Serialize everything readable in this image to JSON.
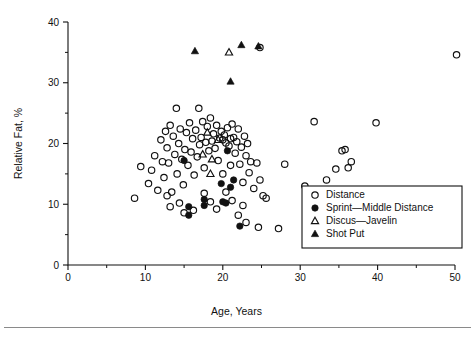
{
  "chart_data": {
    "type": "scatter",
    "title": "",
    "xlabel": "Age, Years",
    "ylabel": "Relative Fat, %",
    "xlim": [
      0,
      50
    ],
    "ylim": [
      0,
      40
    ],
    "xticks": [
      0,
      10,
      20,
      30,
      40,
      50
    ],
    "xtick_labels": [
      "0",
      "10",
      "20",
      "30",
      "40",
      "50"
    ],
    "xminor_ticks": [
      5,
      15,
      25,
      35,
      45
    ],
    "yticks": [
      0,
      10,
      20,
      30,
      40
    ],
    "ytick_labels": [
      "0",
      "10",
      "20",
      "30",
      "40"
    ],
    "yminor_ticks": [
      5,
      15,
      25,
      35
    ],
    "grid": false,
    "legend_position": "lower-right",
    "series": [
      {
        "name": "Distance",
        "marker": "open-circle",
        "color": "#111111",
        "points": [
          [
            8.6,
            11.0
          ],
          [
            9.4,
            16.2
          ],
          [
            10.4,
            13.4
          ],
          [
            10.8,
            15.6
          ],
          [
            11.2,
            18.0
          ],
          [
            11.6,
            12.3
          ],
          [
            12.0,
            20.6
          ],
          [
            12.2,
            17.0
          ],
          [
            12.4,
            14.4
          ],
          [
            12.6,
            22.0
          ],
          [
            12.8,
            19.3
          ],
          [
            13.0,
            16.8
          ],
          [
            13.2,
            23.0
          ],
          [
            13.4,
            12.0
          ],
          [
            13.6,
            21.2
          ],
          [
            13.8,
            18.2
          ],
          [
            14.0,
            25.8
          ],
          [
            14.1,
            15.0
          ],
          [
            14.3,
            20.0
          ],
          [
            14.5,
            22.4
          ],
          [
            14.7,
            17.4
          ],
          [
            14.9,
            13.2
          ],
          [
            15.1,
            19.0
          ],
          [
            15.3,
            21.8
          ],
          [
            15.5,
            16.4
          ],
          [
            15.7,
            23.4
          ],
          [
            15.9,
            18.6
          ],
          [
            16.1,
            20.8
          ],
          [
            16.3,
            14.8
          ],
          [
            16.5,
            22.2
          ],
          [
            16.7,
            17.8
          ],
          [
            16.9,
            25.8
          ],
          [
            17.0,
            19.8
          ],
          [
            17.2,
            21.0
          ],
          [
            17.4,
            23.6
          ],
          [
            17.6,
            16.0
          ],
          [
            17.8,
            20.2
          ],
          [
            18.0,
            22.8
          ],
          [
            18.2,
            18.8
          ],
          [
            18.4,
            24.2
          ],
          [
            18.6,
            20.4
          ],
          [
            18.8,
            21.6
          ],
          [
            19.0,
            19.2
          ],
          [
            19.2,
            23.0
          ],
          [
            19.4,
            17.2
          ],
          [
            19.6,
            20.9
          ],
          [
            19.8,
            22.0
          ],
          [
            20.0,
            20.6
          ],
          [
            20.2,
            21.4
          ],
          [
            20.4,
            20.1
          ],
          [
            20.6,
            22.6
          ],
          [
            20.8,
            19.6
          ],
          [
            21.0,
            20.8
          ],
          [
            21.2,
            23.2
          ],
          [
            21.4,
            21.0
          ],
          [
            21.6,
            18.4
          ],
          [
            21.8,
            20.3
          ],
          [
            22.0,
            22.4
          ],
          [
            22.2,
            16.6
          ],
          [
            22.4,
            19.4
          ],
          [
            22.6,
            13.6
          ],
          [
            22.8,
            21.2
          ],
          [
            23.0,
            18.0
          ],
          [
            23.2,
            20.0
          ],
          [
            23.4,
            15.2
          ],
          [
            23.6,
            17.0
          ],
          [
            24.0,
            12.6
          ],
          [
            24.4,
            16.8
          ],
          [
            24.8,
            14.0
          ],
          [
            25.2,
            11.4
          ],
          [
            13.2,
            9.6
          ],
          [
            14.4,
            10.2
          ],
          [
            15.0,
            8.6
          ],
          [
            16.2,
            9.0
          ],
          [
            17.6,
            11.8
          ],
          [
            18.4,
            10.4
          ],
          [
            19.2,
            9.2
          ],
          [
            20.4,
            12.0
          ],
          [
            21.2,
            10.6
          ],
          [
            22.0,
            8.2
          ],
          [
            22.6,
            9.8
          ],
          [
            23.0,
            7.0
          ],
          [
            24.6,
            6.2
          ],
          [
            27.2,
            6.0
          ],
          [
            28.0,
            16.6
          ],
          [
            30.6,
            13.0
          ],
          [
            31.8,
            23.6
          ],
          [
            33.4,
            14.0
          ],
          [
            34.6,
            15.8
          ],
          [
            35.4,
            18.8
          ],
          [
            35.8,
            19.0
          ],
          [
            36.2,
            16.0
          ],
          [
            36.6,
            17.0
          ],
          [
            39.8,
            23.4
          ],
          [
            50.2,
            34.6
          ],
          [
            24.8,
            35.8
          ],
          [
            25.6,
            11.0
          ],
          [
            12.8,
            11.4
          ],
          [
            20.0,
            15.0
          ],
          [
            21.0,
            16.4
          ]
        ]
      },
      {
        "name": "Sprint—Middle Distance",
        "marker": "filled-circle",
        "color": "#111111",
        "points": [
          [
            15.0,
            17.2
          ],
          [
            20.6,
            18.8
          ],
          [
            21.4,
            14.0
          ],
          [
            21.0,
            12.8
          ],
          [
            15.6,
            9.6
          ],
          [
            15.6,
            8.2
          ],
          [
            17.6,
            10.8
          ],
          [
            17.6,
            9.8
          ],
          [
            20.0,
            10.4
          ],
          [
            20.4,
            10.2
          ],
          [
            22.2,
            6.4
          ],
          [
            19.8,
            13.4
          ]
        ]
      },
      {
        "name": "Discus—Javelin",
        "marker": "open-triangle",
        "color": "#111111",
        "points": [
          [
            18.0,
            21.8
          ],
          [
            19.4,
            20.6
          ],
          [
            17.4,
            18.2
          ],
          [
            18.6,
            17.4
          ],
          [
            18.4,
            15.0
          ],
          [
            20.8,
            35.0
          ]
        ]
      },
      {
        "name": "Shot Put",
        "marker": "filled-triangle",
        "color": "#111111",
        "points": [
          [
            16.4,
            35.2
          ],
          [
            22.4,
            36.2
          ],
          [
            21.0,
            30.2
          ],
          [
            24.6,
            36.0
          ]
        ]
      }
    ]
  },
  "legend": {
    "entries": [
      {
        "label": "Distance",
        "marker": "open-circle"
      },
      {
        "label": "Sprint—Middle Distance",
        "marker": "filled-circle"
      },
      {
        "label": "Discus—Javelin",
        "marker": "open-triangle"
      },
      {
        "label": "Shot Put",
        "marker": "filled-triangle"
      }
    ]
  }
}
